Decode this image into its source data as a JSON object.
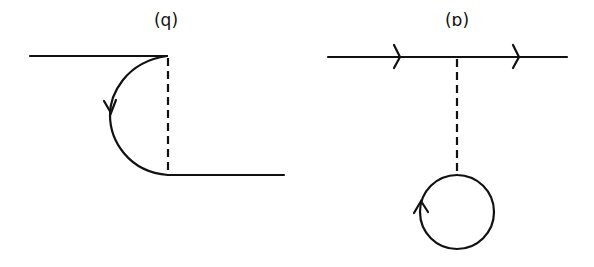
{
  "figure": {
    "panels": [
      {
        "id": "left",
        "label": "(q)",
        "description": "Self-energy style diagram: two horizontal fermion lines offset vertically, connected by a dashed line and a semicircular arc with a downward arrow"
      },
      {
        "id": "right",
        "label": "(ɒ)",
        "description": "Tadpole diagram: horizontal fermion line with two right-pointing arrows, dashed line down to a closed loop with an upward arrow"
      }
    ],
    "colors": {
      "stroke": "#111111",
      "background": "#ffffff"
    }
  }
}
